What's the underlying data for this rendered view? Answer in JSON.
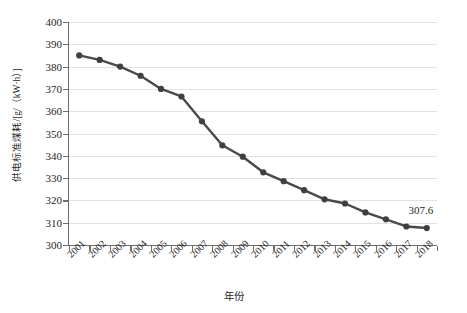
{
  "chart_data": {
    "type": "line",
    "title": "",
    "xlabel": "年份",
    "ylabel": "供电标准煤耗/[g/（kW·h）]",
    "categories": [
      "2001",
      "2002",
      "2003",
      "2004",
      "2005",
      "2006",
      "2007",
      "2008",
      "2009",
      "2010",
      "2011",
      "2012",
      "2013",
      "2014",
      "2015",
      "2016",
      "2017",
      "2018"
    ],
    "values": [
      385.0,
      383.0,
      380.0,
      375.9,
      370.0,
      366.6,
      355.5,
      344.7,
      339.6,
      332.6,
      328.6,
      324.6,
      320.5,
      318.6,
      314.6,
      311.5,
      308.3,
      307.6
    ],
    "ylim": [
      300,
      400
    ],
    "ytick_labels": [
      "300",
      "310",
      "320",
      "330",
      "340",
      "350",
      "360",
      "370",
      "380",
      "390",
      "400"
    ],
    "ytick_values": [
      300,
      310,
      320,
      330,
      340,
      350,
      360,
      370,
      380,
      390,
      400
    ],
    "grid": true,
    "legend": "none",
    "series_color": "#4a4a4a",
    "marker_color": "#3f3f3f",
    "gridline_color": "#e2e2e2",
    "axis_color": "#6d6d6d",
    "annotations": [
      {
        "label": "307.6",
        "x_category": "2018",
        "value": 307.6
      }
    ]
  }
}
